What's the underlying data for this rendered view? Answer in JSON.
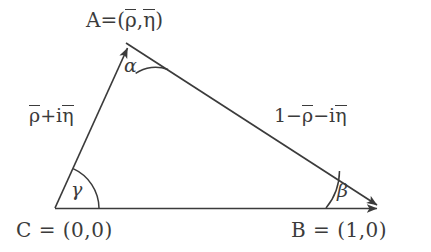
{
  "figure": {
    "type": "unitarity-triangle-diagram",
    "background_color": "#ffffff",
    "stroke_color": "#3b3b3b",
    "text_color": "#3b3b3b",
    "width": 431,
    "height": 252
  },
  "vertices": {
    "apex": {
      "name": "A",
      "label_full": "A=(ρ̄,η̄)",
      "letter": "A",
      "equals": "=(",
      "coord_rho": "ρ",
      "comma": ",",
      "coord_eta": "η",
      "close": ")",
      "x": 124,
      "y": 40
    },
    "left": {
      "name": "C",
      "label_full": "C = (0,0)",
      "x": 55,
      "y": 208
    },
    "right": {
      "name": "B",
      "label_full": "B = (1,0)",
      "x": 385,
      "y": 208
    }
  },
  "sides": {
    "left_side": {
      "label_full": "ρ̄+iη̄",
      "part_rho": "ρ",
      "part_plus_i": "+i",
      "part_eta": "η",
      "from": "C",
      "to": "A"
    },
    "right_side": {
      "label_full": "1−ρ̄−iη̄",
      "part_one_minus": "1−",
      "part_rho": "ρ",
      "part_minus_i": "−i",
      "part_eta": "η",
      "from": "A",
      "to": "B"
    },
    "base_side": {
      "label_full": "",
      "from": "C",
      "to": "B"
    }
  },
  "angles": {
    "alpha": {
      "symbol": "α",
      "at_vertex": "A"
    },
    "beta": {
      "symbol": "β",
      "at_vertex": "B"
    },
    "gamma": {
      "symbol": "γ",
      "at_vertex": "C"
    }
  }
}
